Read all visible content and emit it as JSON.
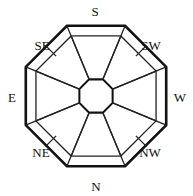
{
  "diagram": {
    "kind": "compass-rose-octagon",
    "title": "",
    "colors": {
      "background": "#ffffff",
      "stroke": "#111111",
      "thin_stroke": "#222222",
      "label": "#111111"
    },
    "geometry": {
      "center": {
        "x": 96,
        "y": 96
      },
      "outer_octagon_radius": 76,
      "inner_band_offset": 11,
      "core_octagon_radius": 18,
      "outer_stroke_width": 2.6,
      "inner_stroke_width": 1.3
    },
    "labels": [
      {
        "id": "label-s",
        "text": "S",
        "x": 95,
        "y": 11,
        "direction": "south"
      },
      {
        "id": "label-sw",
        "text": "SW",
        "x": 151,
        "y": 45,
        "direction": "southwest"
      },
      {
        "id": "label-w",
        "text": "W",
        "x": 180,
        "y": 97,
        "direction": "west"
      },
      {
        "id": "label-nw",
        "text": "NW",
        "x": 150,
        "y": 152,
        "direction": "northwest"
      },
      {
        "id": "label-n",
        "text": "N",
        "x": 96,
        "y": 186,
        "direction": "north"
      },
      {
        "id": "label-ne",
        "text": "NE",
        "x": 41,
        "y": 152,
        "direction": "northeast"
      },
      {
        "id": "label-e",
        "text": "E",
        "x": 12,
        "y": 97,
        "direction": "east"
      },
      {
        "id": "label-se",
        "text": "SE",
        "x": 42,
        "y": 45,
        "direction": "southeast"
      }
    ],
    "sectors": [
      {
        "id": "sector-s",
        "direction": "south",
        "type": "cardinal",
        "has_wedge": true,
        "has_band": true
      },
      {
        "id": "sector-sw",
        "direction": "southwest",
        "type": "ordinal",
        "has_wedge": false,
        "has_band": true,
        "has_tick": true
      },
      {
        "id": "sector-w",
        "direction": "west",
        "type": "cardinal",
        "has_wedge": true,
        "has_band": true
      },
      {
        "id": "sector-nw",
        "direction": "northwest",
        "type": "ordinal",
        "has_wedge": false,
        "has_band": true,
        "has_tick": true
      },
      {
        "id": "sector-n",
        "direction": "north",
        "type": "cardinal",
        "has_wedge": true,
        "has_band": true
      },
      {
        "id": "sector-ne",
        "direction": "northeast",
        "type": "ordinal",
        "has_wedge": false,
        "has_band": true,
        "has_tick": true
      },
      {
        "id": "sector-e",
        "direction": "east",
        "type": "cardinal",
        "has_wedge": true,
        "has_band": true
      },
      {
        "id": "sector-se",
        "direction": "southeast",
        "type": "ordinal",
        "has_wedge": false,
        "has_band": true,
        "has_tick": true
      }
    ]
  }
}
